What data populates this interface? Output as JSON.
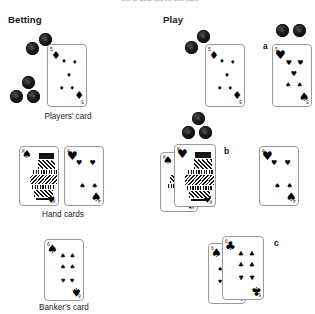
{
  "figure": {
    "clipped_top_caption": "with all cards and the deal starts",
    "columns": [
      {
        "id": "betting",
        "label": "Betting"
      },
      {
        "id": "play",
        "label": "Play"
      }
    ],
    "row_labels": [
      "Players' card",
      "Hand cards",
      "Banker's card"
    ],
    "group_labels": [
      "a",
      "b",
      "c"
    ],
    "colors": {
      "card_face": "#ffffff",
      "card_border": "#9a9a9a",
      "pip_black": "#000000",
      "chip": "#000000",
      "text": "#1a1a1a"
    }
  },
  "cards": {
    "players_card": {
      "rank": "5",
      "suit": "diamonds",
      "suit_glyph": "♦",
      "pip_count": 5
    },
    "play_players_card": {
      "rank": "5",
      "suit": "diamonds",
      "suit_glyph": "♦",
      "pip_count": 5
    },
    "group_a_card": {
      "rank": "5",
      "suit": "hearts",
      "suit_glyph": "♥",
      "pip_count": 5
    },
    "hand_card_left": {
      "rank": "K",
      "suit": "spades",
      "suit_glyph": "♠",
      "pip_count": 0
    },
    "hand_card_right": {
      "rank": "4",
      "suit": "hearts",
      "suit_glyph": "♥",
      "pip_count": 4
    },
    "group_b_back": {
      "rank": "K",
      "suit": "spades",
      "suit_glyph": "♠",
      "pip_count": 0
    },
    "group_b_front": {
      "rank": "K",
      "suit": "hearts",
      "suit_glyph": "♥",
      "pip_count": 0
    },
    "group_b_right": {
      "rank": "4",
      "suit": "hearts",
      "suit_glyph": "♥",
      "pip_count": 4
    },
    "bankers_card": {
      "rank": "6",
      "suit": "spades",
      "suit_glyph": "♠",
      "pip_count": 6
    },
    "group_c_back": {
      "rank": "6",
      "suit": "spades",
      "suit_glyph": "♠",
      "pip_count": 6
    },
    "group_c_front": {
      "rank": "6",
      "suit": "clubs",
      "suit_glyph": "♣",
      "pip_count": 6
    }
  },
  "chip_stacks": {
    "betting_players": {
      "count": 5,
      "note": "2 upper diagonal, 3 lower triangle"
    },
    "play_players": {
      "count": 5,
      "note": "2 upper diagonal, 3 lower triangle"
    },
    "group_a": {
      "count": 2,
      "note": "pair side by side"
    }
  }
}
